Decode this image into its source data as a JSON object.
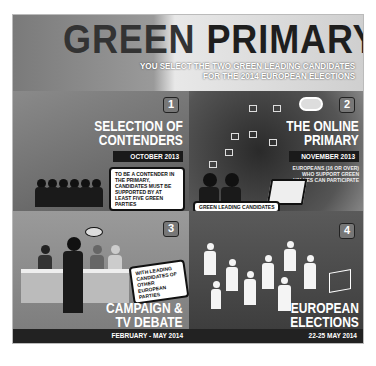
{
  "header": {
    "title_part1": "GREEN",
    "title_part2": "PRIMARY",
    "subtitle_line1": "YOU SELECT THE TWO GREEN LEADING CANDIDATES",
    "subtitle_line2": "FOR THE 2014 EUROPEAN ELECTIONS"
  },
  "steps": [
    {
      "number": "1",
      "title_line1": "SELECTION OF",
      "title_line2": "CONTENDERS",
      "date": "OCTOBER 2013",
      "note": "TO BE A CONTENDER IN THE PRIMARY, CANDIDATES MUST BE SUPPORTED BY AT LEAST FIVE GREEN PARTIES"
    },
    {
      "number": "2",
      "title_line1": "THE ONLINE",
      "title_line2": "PRIMARY",
      "date": "NOVEMBER 2013",
      "note": "EUROPEANS (16 OR OVER) WHO SUPPORT GREEN VALUES CAN PARTICIPATE",
      "label": "GREEN LEADING CANDIDATES"
    },
    {
      "number": "3",
      "title_line1": "CAMPAIGN &",
      "title_line2": "TV DEBATE",
      "date": "FEBRUARY - MAY 2014",
      "note": "WITH LEADING CANDIDATES OF OTHER EUROPEAN PARTIES"
    },
    {
      "number": "4",
      "title_line1": "EUROPEAN",
      "title_line2": "ELECTIONS",
      "date": "22-25 MAY 2014"
    }
  ]
}
